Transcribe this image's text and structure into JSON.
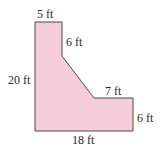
{
  "figure": {
    "fill_color": "#f5cdd8",
    "stroke_color": "#4a4a4a",
    "polygon_points": "35,22 62,22 62,56 94,98 133,98 133,131 35,131",
    "labels": {
      "top": "5 ft",
      "upper_right_vertical": "6 ft",
      "left": "20 ft",
      "step_horizontal": "7 ft",
      "right": "6 ft",
      "bottom": "18 ft"
    }
  }
}
